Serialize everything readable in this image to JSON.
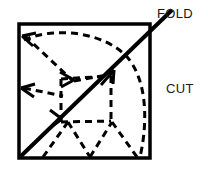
{
  "figure": {
    "type": "line-diagram",
    "background_color": "#ffffff",
    "stroke_color": "#000000",
    "labels": {
      "fold": "FOLD",
      "cut": "CUT"
    },
    "square": {
      "left": 19,
      "top": 24,
      "right": 150,
      "bottom": 158,
      "stroke_width": 3
    },
    "fold_line": {
      "description": "solid diagonal from bottom-left corner to beyond top-right corner",
      "x1": 20,
      "y1": 157,
      "x2": 172,
      "y2": 10,
      "stroke_width": 4,
      "arrowhead_at": [
        110,
        72
      ]
    },
    "cut_lines": {
      "style": "dashed",
      "stroke_width": 3,
      "dash_pattern": "7 5"
    }
  }
}
